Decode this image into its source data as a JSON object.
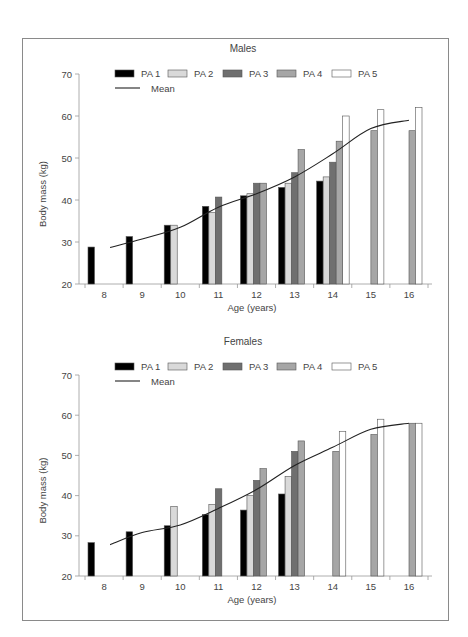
{
  "chart_data": [
    {
      "type": "bar",
      "title": "Males",
      "xlabel": "Age (years)",
      "ylabel": "Body mass (kg)",
      "ylim": [
        20,
        70
      ],
      "yticks": [
        20,
        30,
        40,
        50,
        60,
        70
      ],
      "categories": [
        "8",
        "9",
        "10",
        "11",
        "12",
        "13",
        "14",
        "15",
        "16"
      ],
      "legend": [
        "PA 1",
        "PA 2",
        "PA 3",
        "PA 4",
        "PA 5",
        "Mean"
      ],
      "series": [
        {
          "name": "PA 1",
          "color": "#000000",
          "values": [
            28.8,
            31.3,
            34.0,
            38.5,
            41.0,
            43.0,
            44.5,
            null,
            null
          ]
        },
        {
          "name": "PA 2",
          "color": "#d9d9d9",
          "values": [
            null,
            null,
            34.0,
            37.0,
            41.5,
            44.0,
            45.5,
            null,
            null
          ]
        },
        {
          "name": "PA 3",
          "color": "#6f6f6f",
          "values": [
            null,
            null,
            null,
            40.7,
            44.0,
            46.5,
            49.0,
            null,
            null
          ]
        },
        {
          "name": "PA 4",
          "color": "#a6a6a6",
          "values": [
            null,
            null,
            null,
            null,
            44.0,
            52.0,
            54.0,
            56.5,
            56.5
          ]
        },
        {
          "name": "PA 5",
          "color": "#ffffff",
          "values": [
            null,
            null,
            null,
            null,
            null,
            null,
            60.0,
            61.5,
            62.0
          ]
        }
      ],
      "mean": {
        "name": "Mean",
        "type": "line",
        "values": [
          28.7,
          30.7,
          33.5,
          38.3,
          41.5,
          45.5,
          51.0,
          57.0,
          59.0
        ]
      }
    },
    {
      "type": "bar",
      "title": "Females",
      "xlabel": "Age (years)",
      "ylabel": "Body mass (kg)",
      "ylim": [
        20,
        70
      ],
      "yticks": [
        20,
        30,
        40,
        50,
        60,
        70
      ],
      "categories": [
        "8",
        "9",
        "10",
        "11",
        "12",
        "13",
        "14",
        "15",
        "16"
      ],
      "legend": [
        "PA 1",
        "PA 2",
        "PA 3",
        "PA 4",
        "PA 5",
        "Mean"
      ],
      "series": [
        {
          "name": "PA 1",
          "color": "#000000",
          "values": [
            28.3,
            31.0,
            32.5,
            35.3,
            36.4,
            40.4,
            null,
            null,
            null
          ]
        },
        {
          "name": "PA 2",
          "color": "#d9d9d9",
          "values": [
            null,
            null,
            37.3,
            37.8,
            40.0,
            44.8,
            null,
            null,
            null
          ]
        },
        {
          "name": "PA 3",
          "color": "#6f6f6f",
          "values": [
            null,
            null,
            null,
            41.7,
            43.8,
            51.0,
            null,
            null,
            null
          ]
        },
        {
          "name": "PA 4",
          "color": "#a6a6a6",
          "values": [
            null,
            null,
            null,
            null,
            46.7,
            53.6,
            51.0,
            55.2,
            58.0
          ]
        },
        {
          "name": "PA 5",
          "color": "#ffffff",
          "values": [
            null,
            null,
            null,
            null,
            null,
            null,
            56.0,
            59.0,
            58.0
          ]
        }
      ],
      "mean": {
        "name": "Mean",
        "type": "line",
        "values": [
          27.8,
          30.8,
          32.7,
          36.8,
          41.5,
          47.5,
          52.0,
          56.5,
          58.0
        ]
      }
    }
  ],
  "panels": [
    {
      "title": "Males",
      "xlabel": "Age (years)",
      "ylabel": "Body mass (kg)"
    },
    {
      "title": "Females",
      "xlabel": "Age (years)",
      "ylabel": "Body mass (kg)"
    }
  ]
}
